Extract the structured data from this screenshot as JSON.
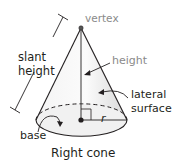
{
  "diagram": {
    "title": "Right cone",
    "labels": {
      "vertex": "vertex",
      "slant_height_line1": "slant",
      "slant_height_line2": "height",
      "height": "height",
      "lateral_surface_line1": "lateral",
      "lateral_surface_line2": "surface",
      "radius": "r",
      "base": "base"
    },
    "colors": {
      "outline": "#231f20",
      "label_grey": "#8a8a8a",
      "fill_light": "#f2f2f2",
      "fill_shade": "#dcdcdc"
    },
    "geometry": {
      "vertex": [
        81,
        28
      ],
      "base_center": [
        81,
        120
      ],
      "base_rx": 46,
      "base_ry": 16
    }
  }
}
